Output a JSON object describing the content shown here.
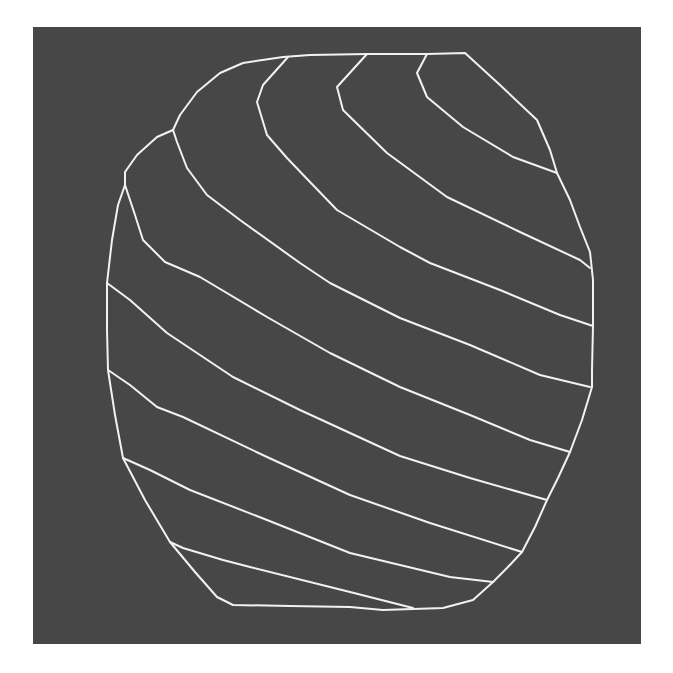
{
  "figure": {
    "colors": {
      "page_background": "#ffffff",
      "panel_background": "#474747",
      "line": "#f2f2f2"
    },
    "panel": {
      "x": 33,
      "y": 27,
      "width": 608,
      "height": 617
    },
    "outline": {
      "name": "region-boundary",
      "points": [
        [
          173,
          130
        ],
        [
          180,
          115
        ],
        [
          197,
          92
        ],
        [
          220,
          73
        ],
        [
          243,
          63
        ],
        [
          283,
          57
        ],
        [
          310,
          55
        ],
        [
          367,
          54
        ],
        [
          427,
          54
        ],
        [
          465,
          53
        ],
        [
          500,
          85
        ],
        [
          537,
          120
        ],
        [
          550,
          150
        ],
        [
          557,
          173
        ],
        [
          570,
          200
        ],
        [
          580,
          227
        ],
        [
          590,
          252
        ],
        [
          593,
          280
        ],
        [
          593,
          326
        ],
        [
          592,
          370
        ],
        [
          592,
          387
        ],
        [
          582,
          420
        ],
        [
          570,
          452
        ],
        [
          558,
          478
        ],
        [
          547,
          500
        ],
        [
          535,
          527
        ],
        [
          522,
          552
        ],
        [
          507,
          568
        ],
        [
          493,
          582
        ],
        [
          473,
          600
        ],
        [
          443,
          608
        ],
        [
          413,
          609
        ],
        [
          383,
          610
        ],
        [
          350,
          607
        ],
        [
          290,
          606
        ],
        [
          233,
          605
        ],
        [
          217,
          597
        ],
        [
          195,
          572
        ],
        [
          170,
          542
        ],
        [
          145,
          500
        ],
        [
          123,
          458
        ],
        [
          115,
          415
        ],
        [
          108,
          370
        ],
        [
          107,
          330
        ],
        [
          107,
          283
        ],
        [
          112,
          240
        ],
        [
          118,
          205
        ],
        [
          125,
          185
        ],
        [
          125,
          172
        ],
        [
          137,
          155
        ],
        [
          157,
          137
        ],
        [
          173,
          130
        ]
      ]
    },
    "contour_lines": [
      {
        "id": 1,
        "points": [
          [
            427,
            54
          ],
          [
            417,
            73
          ],
          [
            427,
            97
          ],
          [
            463,
            127
          ],
          [
            513,
            157
          ],
          [
            557,
            173
          ]
        ]
      },
      {
        "id": 2,
        "points": [
          [
            367,
            54
          ],
          [
            337,
            87
          ],
          [
            343,
            110
          ],
          [
            387,
            153
          ],
          [
            447,
            197
          ],
          [
            520,
            232
          ],
          [
            580,
            260
          ],
          [
            590,
            268
          ]
        ]
      },
      {
        "id": 3,
        "points": [
          [
            288,
            57
          ],
          [
            263,
            85
          ],
          [
            257,
            102
          ],
          [
            267,
            135
          ],
          [
            287,
            158
          ],
          [
            310,
            182
          ],
          [
            337,
            210
          ],
          [
            400,
            247
          ],
          [
            430,
            263
          ],
          [
            500,
            290
          ],
          [
            560,
            315
          ],
          [
            593,
            326
          ]
        ]
      },
      {
        "id": 4,
        "points": [
          [
            173,
            130
          ],
          [
            177,
            142
          ],
          [
            187,
            168
          ],
          [
            207,
            195
          ],
          [
            240,
            220
          ],
          [
            300,
            263
          ],
          [
            330,
            283
          ],
          [
            400,
            318
          ],
          [
            470,
            345
          ],
          [
            540,
            375
          ],
          [
            590,
            387
          ]
        ]
      },
      {
        "id": 5,
        "points": [
          [
            125,
            185
          ],
          [
            135,
            215
          ],
          [
            143,
            240
          ],
          [
            165,
            262
          ],
          [
            200,
            277
          ],
          [
            267,
            317
          ],
          [
            330,
            353
          ],
          [
            400,
            387
          ],
          [
            470,
            415
          ],
          [
            530,
            440
          ],
          [
            570,
            452
          ]
        ]
      },
      {
        "id": 6,
        "points": [
          [
            107,
            283
          ],
          [
            130,
            300
          ],
          [
            167,
            333
          ],
          [
            233,
            377
          ],
          [
            300,
            410
          ],
          [
            400,
            456
          ],
          [
            470,
            478
          ],
          [
            547,
            500
          ]
        ]
      },
      {
        "id": 7,
        "points": [
          [
            108,
            370
          ],
          [
            130,
            385
          ],
          [
            157,
            407
          ],
          [
            183,
            417
          ],
          [
            267,
            457
          ],
          [
            350,
            495
          ],
          [
            430,
            523
          ],
          [
            522,
            552
          ]
        ]
      },
      {
        "id": 8,
        "points": [
          [
            123,
            458
          ],
          [
            150,
            470
          ],
          [
            190,
            490
          ],
          [
            267,
            520
          ],
          [
            350,
            553
          ],
          [
            450,
            577
          ],
          [
            493,
            582
          ]
        ]
      },
      {
        "id": 9,
        "points": [
          [
            170,
            542
          ],
          [
            183,
            548
          ],
          [
            223,
            560
          ],
          [
            250,
            567
          ],
          [
            350,
            592
          ],
          [
            413,
            608
          ]
        ]
      }
    ]
  }
}
